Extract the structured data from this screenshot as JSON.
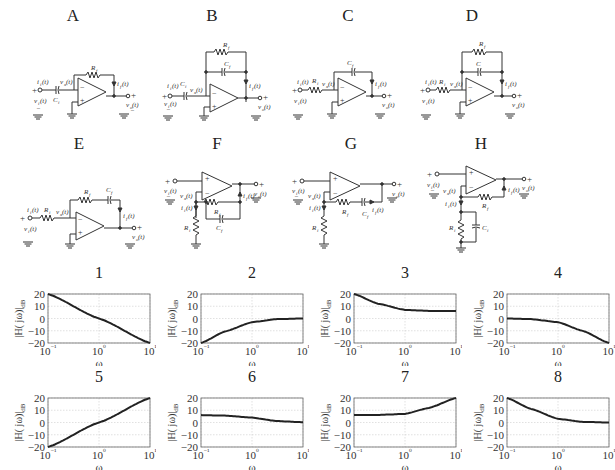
{
  "circuits": [
    {
      "label": "A",
      "input_element": "C_i",
      "feedback": "R_f",
      "topology": "inverting"
    },
    {
      "label": "B",
      "input_element": "C_i",
      "feedback": "R_f || C_f",
      "topology": "inverting"
    },
    {
      "label": "C",
      "input_element": "R_i",
      "feedback": "C_f",
      "topology": "inverting"
    },
    {
      "label": "D",
      "input_element": "R_i",
      "feedback": "R_f || C",
      "topology": "inverting"
    },
    {
      "label": "E",
      "input_element": "R_i",
      "feedback": "R_f + C_f (series)",
      "topology": "inverting"
    },
    {
      "label": "F",
      "ground_element": "R_i",
      "feedback": "R_f || C_f",
      "topology": "non-inverting"
    },
    {
      "label": "G",
      "ground_element": "R_i",
      "feedback": "R_f + C_f (series)",
      "topology": "non-inverting"
    },
    {
      "label": "H",
      "ground_element": "R_i || C_i",
      "feedback": "R_f",
      "topology": "non-inverting"
    }
  ],
  "labels": {
    "vi": "v",
    "vi_sub": "i",
    "vo": "v",
    "vo_sub": "o",
    "vx": "v",
    "vx_sub": "x",
    "ii": "i",
    "ii_sub": "i",
    "if": "i",
    "if_sub": "f",
    "t": "(t)",
    "Ri": "R",
    "Ri_sub": "i",
    "Rf": "R",
    "Rf_sub": "f",
    "Ci": "C",
    "Ci_sub": "i",
    "Cf": "C",
    "Cf_sub": "f",
    "C": "C",
    "plus": "+",
    "minus": "−"
  },
  "chart_data": [
    {
      "title": "1",
      "type": "line",
      "xscale": "log",
      "xlabel": "ω",
      "ylabel": "|H(jω)|dB",
      "xlim": [
        0.1,
        10
      ],
      "ylim": [
        -20,
        20
      ],
      "xticks": [
        "10⁻¹",
        "10⁰",
        "10¹"
      ],
      "yticks": [
        20,
        10,
        0,
        -10,
        -20
      ],
      "grid": true,
      "x": [
        0.1,
        1,
        10
      ],
      "y": [
        20,
        0,
        -20
      ]
    },
    {
      "title": "2",
      "type": "line",
      "xscale": "log",
      "xlabel": "ω",
      "ylabel": "|H(jω)|dB",
      "xlim": [
        0.1,
        10
      ],
      "ylim": [
        -20,
        20
      ],
      "xticks": [
        "10⁻¹",
        "10⁰",
        "10¹"
      ],
      "yticks": [
        20,
        10,
        0,
        -10,
        -20
      ],
      "grid": true,
      "x": [
        0.1,
        0.3,
        1,
        3,
        10
      ],
      "y": [
        -20,
        -10.5,
        -3,
        -0.5,
        0
      ]
    },
    {
      "title": "3",
      "type": "line",
      "xscale": "log",
      "xlabel": "ω",
      "ylabel": "|H(jω)|dB",
      "xlim": [
        0.1,
        10
      ],
      "ylim": [
        -20,
        20
      ],
      "xticks": [
        "10⁻¹",
        "10⁰",
        "10¹"
      ],
      "yticks": [
        20,
        10,
        0,
        -10,
        -20
      ],
      "grid": true,
      "x": [
        0.1,
        0.3,
        1,
        3,
        10
      ],
      "y": [
        20,
        12,
        7,
        6.2,
        6
      ]
    },
    {
      "title": "4",
      "type": "line",
      "xscale": "log",
      "xlabel": "ω",
      "ylabel": "|H(jω)|dB",
      "xlim": [
        0.1,
        10
      ],
      "ylim": [
        -20,
        20
      ],
      "xticks": [
        "10⁻¹",
        "10⁰",
        "10¹"
      ],
      "yticks": [
        20,
        10,
        0,
        -10,
        -20
      ],
      "grid": true,
      "x": [
        0.1,
        0.3,
        1,
        3,
        10
      ],
      "y": [
        0,
        -0.5,
        -3,
        -10,
        -20
      ]
    },
    {
      "title": "5",
      "type": "line",
      "xscale": "log",
      "xlabel": "ω",
      "ylabel": "|H(jω)|dB",
      "xlim": [
        0.1,
        10
      ],
      "ylim": [
        -20,
        20
      ],
      "xticks": [
        "10⁻¹",
        "10⁰",
        "10¹"
      ],
      "yticks": [
        20,
        10,
        0,
        -10,
        -20
      ],
      "grid": true,
      "x": [
        0.1,
        1,
        10
      ],
      "y": [
        -20,
        0,
        20
      ]
    },
    {
      "title": "6",
      "type": "line",
      "xscale": "log",
      "xlabel": "ω",
      "ylabel": "|H(jω)|dB",
      "xlim": [
        0.1,
        10
      ],
      "ylim": [
        -20,
        20
      ],
      "xticks": [
        "10⁻¹",
        "10⁰",
        "10¹"
      ],
      "yticks": [
        20,
        10,
        0,
        -10,
        -20
      ],
      "grid": true,
      "x": [
        0.1,
        0.3,
        1,
        3,
        10
      ],
      "y": [
        6,
        5.6,
        4,
        1.2,
        0.2
      ]
    },
    {
      "title": "7",
      "type": "line",
      "xscale": "log",
      "xlabel": "ω",
      "ylabel": "|H(jω)|dB",
      "xlim": [
        0.1,
        10
      ],
      "ylim": [
        -20,
        20
      ],
      "xticks": [
        "10⁻¹",
        "10⁰",
        "10¹"
      ],
      "yticks": [
        20,
        10,
        0,
        -10,
        -20
      ],
      "grid": true,
      "x": [
        0.1,
        0.3,
        1,
        3,
        10
      ],
      "y": [
        6,
        6.2,
        7,
        12,
        20
      ]
    },
    {
      "title": "8",
      "type": "line",
      "xscale": "log",
      "xlabel": "ω",
      "ylabel": "|H(jω)|dB",
      "xlim": [
        0.1,
        10
      ],
      "ylim": [
        -20,
        20
      ],
      "xticks": [
        "10⁻¹",
        "10⁰",
        "10¹"
      ],
      "yticks": [
        20,
        10,
        0,
        -10,
        -20
      ],
      "grid": true,
      "x": [
        0.1,
        0.3,
        1,
        3,
        10
      ],
      "y": [
        20,
        11,
        3,
        0.5,
        0
      ]
    }
  ]
}
